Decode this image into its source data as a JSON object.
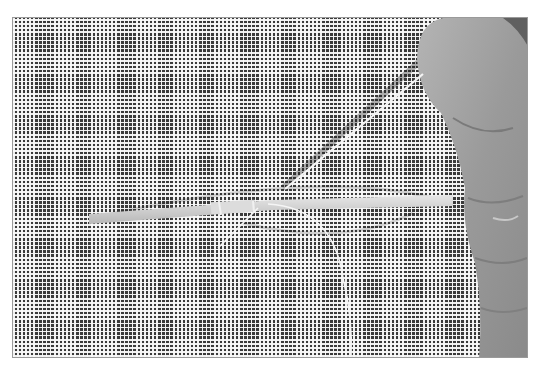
{
  "image": {
    "description": "Grayscale photograph of a fine mesh grid with a thin rod lying horizontally, a needle angled up to the right, and a curved suture thread, held by fingers on the right side.",
    "colors": {
      "mesh_dark": "#3a3a3a",
      "mesh_light": "#fafafa",
      "skin": "#9c9c9c",
      "skin_dark": "#707070",
      "rod": "#d4d4d4",
      "thread": "#f5f5f5",
      "border": "#9a9a9a"
    },
    "elements": [
      "mesh-grid",
      "rod",
      "needle",
      "suture-thread",
      "fingers"
    ]
  }
}
